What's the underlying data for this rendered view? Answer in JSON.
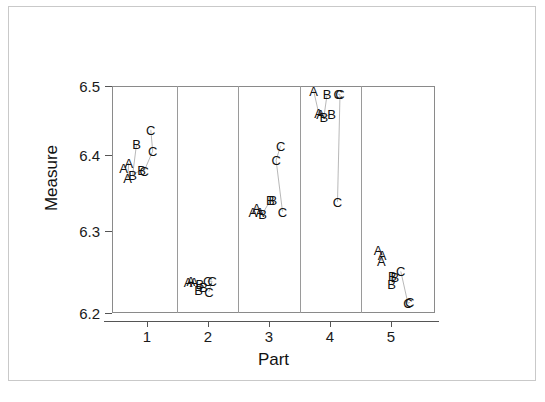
{
  "chart_data": {
    "type": "scatter",
    "title": "",
    "xlabel": "Part",
    "ylabel": "Measure",
    "xlim": [
      0.5,
      5.5
    ],
    "ylim": [
      6.2,
      6.5
    ],
    "x_categories": [
      "1",
      "2",
      "3",
      "4",
      "5"
    ],
    "x_tick_labels": [
      "1",
      "2",
      "3",
      "4",
      "5"
    ],
    "y_tick_labels": [
      "6.2",
      "6.3",
      "6.4",
      "6.5"
    ],
    "y_tick_values": [
      6.2,
      6.3,
      6.4,
      6.5
    ],
    "grid": false,
    "legend": "none",
    "panels": true,
    "marker_style": "operator-letter",
    "operators": [
      "A",
      "B",
      "C"
    ],
    "series": [
      {
        "name": "A",
        "points": [
          {
            "part": 1,
            "x": 0.68,
            "y": 6.392,
            "label": "A"
          },
          {
            "part": 1,
            "x": 0.76,
            "y": 6.398,
            "label": "A"
          },
          {
            "part": 1,
            "x": 0.74,
            "y": 6.378,
            "label": "A"
          },
          {
            "part": 2,
            "x": 1.68,
            "y": 6.241,
            "label": "A"
          },
          {
            "part": 2,
            "x": 1.72,
            "y": 6.242,
            "label": "A"
          },
          {
            "part": 2,
            "x": 1.77,
            "y": 6.241,
            "label": "A"
          },
          {
            "part": 3,
            "x": 2.68,
            "y": 6.334,
            "label": "A"
          },
          {
            "part": 3,
            "x": 2.74,
            "y": 6.339,
            "label": "A"
          },
          {
            "part": 3,
            "x": 2.79,
            "y": 6.333,
            "label": "A"
          },
          {
            "part": 4,
            "x": 3.62,
            "y": 6.494,
            "label": "A"
          },
          {
            "part": 4,
            "x": 3.7,
            "y": 6.464,
            "label": "A"
          },
          {
            "part": 4,
            "x": 3.73,
            "y": 6.463,
            "label": "A"
          },
          {
            "part": 5,
            "x": 4.62,
            "y": 6.283,
            "label": "A"
          },
          {
            "part": 5,
            "x": 4.68,
            "y": 6.277,
            "label": "A"
          },
          {
            "part": 5,
            "x": 4.67,
            "y": 6.269,
            "label": "A"
          }
        ]
      },
      {
        "name": "B",
        "points": [
          {
            "part": 1,
            "x": 0.88,
            "y": 6.423,
            "label": "B"
          },
          {
            "part": 1,
            "x": 0.82,
            "y": 6.383,
            "label": "B"
          },
          {
            "part": 1,
            "x": 0.96,
            "y": 6.389,
            "label": "B"
          },
          {
            "part": 2,
            "x": 1.86,
            "y": 6.239,
            "label": "B"
          },
          {
            "part": 2,
            "x": 1.84,
            "y": 6.23,
            "label": "B"
          },
          {
            "part": 2,
            "x": 1.92,
            "y": 6.235,
            "label": "B"
          },
          {
            "part": 3,
            "x": 2.83,
            "y": 6.331,
            "label": "B"
          },
          {
            "part": 3,
            "x": 2.95,
            "y": 6.349,
            "label": "B"
          },
          {
            "part": 3,
            "x": 2.99,
            "y": 6.349,
            "label": "B"
          },
          {
            "part": 4,
            "x": 3.83,
            "y": 6.489,
            "label": "B"
          },
          {
            "part": 4,
            "x": 3.78,
            "y": 6.459,
            "label": "B"
          },
          {
            "part": 4,
            "x": 3.9,
            "y": 6.463,
            "label": "B"
          },
          {
            "part": 5,
            "x": 4.84,
            "y": 6.249,
            "label": "B"
          },
          {
            "part": 5,
            "x": 4.88,
            "y": 6.248,
            "label": "B"
          },
          {
            "part": 5,
            "x": 4.83,
            "y": 6.239,
            "label": "B"
          }
        ]
      },
      {
        "name": "C",
        "points": [
          {
            "part": 1,
            "x": 1.1,
            "y": 6.442,
            "label": "C"
          },
          {
            "part": 1,
            "x": 1.13,
            "y": 6.414,
            "label": "C"
          },
          {
            "part": 1,
            "x": 1.0,
            "y": 6.388,
            "label": "C"
          },
          {
            "part": 2,
            "x": 1.98,
            "y": 6.242,
            "label": "C"
          },
          {
            "part": 2,
            "x": 2.05,
            "y": 6.242,
            "label": "C"
          },
          {
            "part": 2,
            "x": 2.0,
            "y": 6.228,
            "label": "C"
          },
          {
            "part": 3,
            "x": 3.11,
            "y": 6.421,
            "label": "C"
          },
          {
            "part": 3,
            "x": 3.04,
            "y": 6.402,
            "label": "C"
          },
          {
            "part": 3,
            "x": 3.14,
            "y": 6.334,
            "label": "C"
          },
          {
            "part": 4,
            "x": 4.0,
            "y": 6.489,
            "label": "C"
          },
          {
            "part": 4,
            "x": 4.03,
            "y": 6.489,
            "label": "C"
          },
          {
            "part": 4,
            "x": 3.99,
            "y": 6.347,
            "label": "C"
          },
          {
            "part": 5,
            "x": 4.97,
            "y": 6.255,
            "label": "C"
          },
          {
            "part": 5,
            "x": 5.08,
            "y": 6.213,
            "label": "C"
          },
          {
            "part": 5,
            "x": 5.11,
            "y": 6.214,
            "label": "C"
          }
        ]
      }
    ]
  },
  "axes": {
    "y_title": "Measure",
    "x_title": "Part",
    "y_ticks": [
      {
        "label": "6.5",
        "value": 6.5
      },
      {
        "label": "6.4",
        "value": 6.4
      },
      {
        "label": "6.3",
        "value": 6.3
      },
      {
        "label": "6.2",
        "value": 6.2
      }
    ],
    "x_ticks": [
      {
        "label": "1",
        "value": 1
      },
      {
        "label": "2",
        "value": 2
      },
      {
        "label": "3",
        "value": 3
      },
      {
        "label": "4",
        "value": 4
      },
      {
        "label": "5",
        "value": 5
      }
    ]
  },
  "caption": {
    "text": ""
  }
}
